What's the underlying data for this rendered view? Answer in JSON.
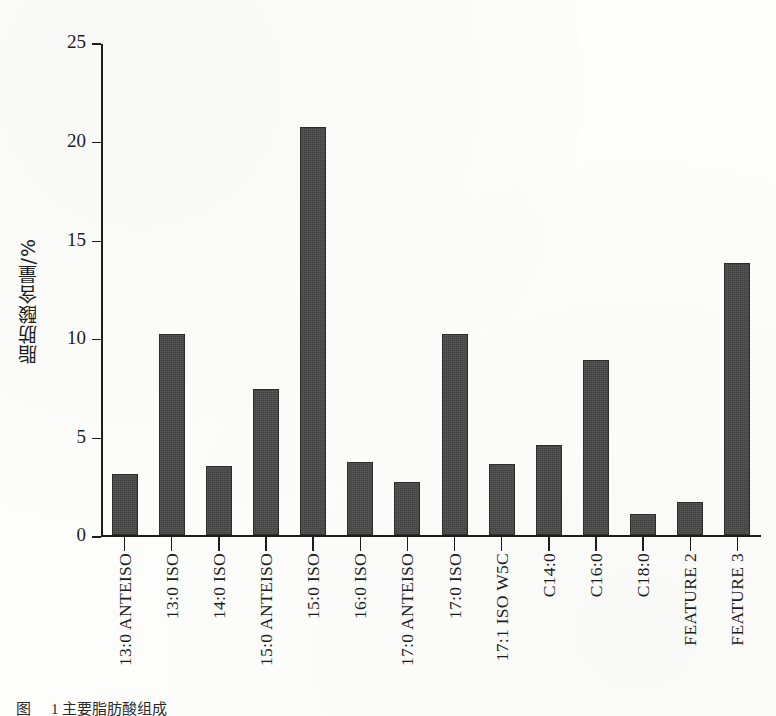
{
  "figure": {
    "y_axis_title": "脂肪酸含量/%",
    "caption_label": "图",
    "caption_text": "1   主要脂肪酸组成"
  },
  "chart_data": {
    "type": "bar",
    "title": "",
    "xlabel": "",
    "ylabel": "脂肪酸含量/%",
    "ylim": [
      0,
      25
    ],
    "yticks": [
      0,
      5,
      10,
      15,
      20,
      25
    ],
    "ytick_labels": [
      "0",
      "5",
      "10",
      "15",
      "20",
      "25"
    ],
    "grid": false,
    "legend": null,
    "bar_color": "#474747",
    "categories": [
      "13:0 ANTEISO",
      "13:0 ISO",
      "14:0 ISO",
      "15:0 ANTEISO",
      "15:0 ISO",
      "16:0 ISO",
      "17:0 ANTEISO",
      "17:0 ISO",
      "17:1 ISO W5C",
      "C14:0",
      "C16:0",
      "C18:0",
      "FEATURE 2",
      "FEATURE 3"
    ],
    "values": [
      3.1,
      10.2,
      3.5,
      7.4,
      20.7,
      3.7,
      2.7,
      10.2,
      3.6,
      4.6,
      8.9,
      1.1,
      1.7,
      13.8
    ]
  }
}
